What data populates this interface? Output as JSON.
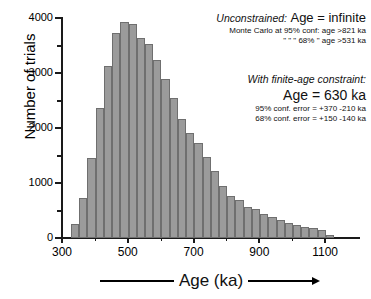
{
  "chart_data": {
    "type": "bar",
    "title": "",
    "xlabel": "Age (ka)",
    "ylabel": "Number of trials",
    "xlim": [
      300,
      1200
    ],
    "ylim": [
      0,
      4000
    ],
    "grid": false,
    "legend": "none",
    "bin_width": 25,
    "categories": [
      340,
      365,
      390,
      415,
      440,
      465,
      490,
      515,
      540,
      565,
      590,
      615,
      640,
      665,
      690,
      715,
      740,
      765,
      790,
      815,
      840,
      865,
      890,
      915,
      940,
      965,
      990,
      1015,
      1040,
      1065,
      1090,
      1115
    ],
    "values": [
      260,
      720,
      1450,
      2370,
      3120,
      3730,
      3920,
      3890,
      3630,
      3520,
      3230,
      2900,
      2540,
      2170,
      1910,
      1730,
      1470,
      1210,
      950,
      760,
      690,
      570,
      520,
      440,
      390,
      330,
      280,
      230,
      200,
      190,
      150,
      60
    ],
    "xticks": [
      300,
      500,
      700,
      900,
      1100
    ],
    "yticks": [
      0,
      1000,
      2000,
      3000,
      4000
    ],
    "yticks_minor": [
      500,
      1500,
      2500,
      3500
    ],
    "bar_color": "#9b9b9b",
    "bar_edge_color": "#6f6f6f",
    "axis_color": "#1a1a1a"
  },
  "axes": {
    "y_title": "Number of trials",
    "x_title": "Age (ka)",
    "y_tick_labels": [
      "0",
      "1000",
      "2000",
      "3000",
      "4000"
    ],
    "x_tick_labels": [
      "300",
      "500",
      "700",
      "900",
      "1100"
    ]
  },
  "annotations": {
    "unconstrained": {
      "label": "Unconstrained:",
      "value": "Age = infinite",
      "rows": [
        {
          "left": "Monte Carlo at 95% conf:",
          "right": "age >821 ka"
        },
        {
          "left": "\"          \"        \"  68%    \"",
          "right": "age >531 ka"
        }
      ]
    },
    "finite": {
      "title": "With finite-age constraint:",
      "value": "Age = 630 ka",
      "rows": [
        "95% conf. error = +370  -210 ka",
        "68% conf. error = +150  -140 ka"
      ]
    }
  }
}
